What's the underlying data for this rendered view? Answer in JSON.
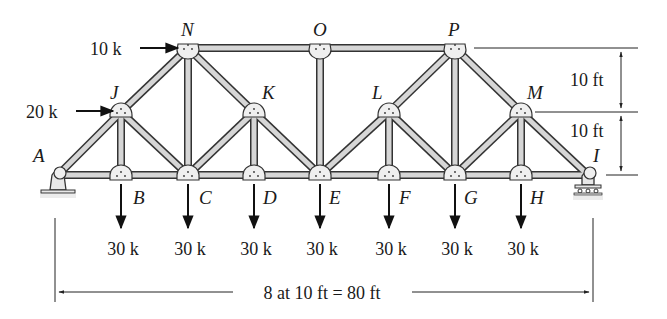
{
  "joints": {
    "A": {
      "label": "A",
      "x": 58,
      "y": 175,
      "label_x": 33,
      "label_y": 162
    },
    "B": {
      "label": "B",
      "x": 121,
      "y": 175,
      "label_x": 133,
      "label_y": 204
    },
    "C": {
      "label": "C",
      "x": 188,
      "y": 175,
      "label_x": 199,
      "label_y": 204
    },
    "D": {
      "label": "D",
      "x": 254,
      "y": 175,
      "label_x": 263,
      "label_y": 204
    },
    "E": {
      "label": "E",
      "x": 320,
      "y": 175,
      "label_x": 329,
      "label_y": 204
    },
    "F": {
      "label": "F",
      "x": 389,
      "y": 175,
      "label_x": 399,
      "label_y": 204
    },
    "G": {
      "label": "G",
      "x": 455,
      "y": 175,
      "label_x": 464,
      "label_y": 204
    },
    "H": {
      "label": "H",
      "x": 521,
      "y": 175,
      "label_x": 530,
      "label_y": 204
    },
    "I": {
      "label": "I",
      "x": 588,
      "y": 175,
      "label_x": 593,
      "label_y": 162
    },
    "J": {
      "label": "J",
      "x": 121,
      "y": 112,
      "label_x": 110,
      "label_y": 99
    },
    "K": {
      "label": "K",
      "x": 254,
      "y": 112,
      "label_x": 262,
      "label_y": 99
    },
    "L": {
      "label": "L",
      "x": 389,
      "y": 112,
      "label_x": 372,
      "label_y": 99
    },
    "M": {
      "label": "M",
      "x": 521,
      "y": 112,
      "label_x": 527,
      "label_y": 99
    },
    "N": {
      "label": "N",
      "x": 188,
      "y": 48,
      "label_x": 181,
      "label_y": 36
    },
    "O": {
      "label": "O",
      "x": 320,
      "y": 48,
      "label_x": 313,
      "label_y": 36
    },
    "P": {
      "label": "P",
      "x": 455,
      "y": 48,
      "label_x": 448,
      "label_y": 36
    }
  },
  "members": [
    [
      "A",
      "B"
    ],
    [
      "B",
      "C"
    ],
    [
      "C",
      "D"
    ],
    [
      "D",
      "E"
    ],
    [
      "E",
      "F"
    ],
    [
      "F",
      "G"
    ],
    [
      "G",
      "H"
    ],
    [
      "H",
      "I"
    ],
    [
      "A",
      "J"
    ],
    [
      "J",
      "N"
    ],
    [
      "N",
      "O"
    ],
    [
      "O",
      "P"
    ],
    [
      "P",
      "M"
    ],
    [
      "M",
      "I"
    ],
    [
      "J",
      "B"
    ],
    [
      "N",
      "C"
    ],
    [
      "K",
      "D"
    ],
    [
      "O",
      "E"
    ],
    [
      "L",
      "F"
    ],
    [
      "P",
      "G"
    ],
    [
      "M",
      "H"
    ],
    [
      "J",
      "C"
    ],
    [
      "N",
      "K"
    ],
    [
      "K",
      "C"
    ],
    [
      "K",
      "E"
    ],
    [
      "L",
      "E"
    ],
    [
      "L",
      "P"
    ],
    [
      "L",
      "G"
    ],
    [
      "M",
      "G"
    ]
  ],
  "horizontal_loads": [
    {
      "label": "10 k",
      "joint": "N",
      "text_x": 90,
      "text_y": 55,
      "x1": 140,
      "x2": 178,
      "y": 48
    },
    {
      "label": "20 k",
      "joint": "J",
      "text_x": 26,
      "text_y": 118,
      "x1": 76,
      "x2": 113,
      "y": 111
    }
  ],
  "vertical_loads": [
    {
      "label": "30 k",
      "joint": "B",
      "x": 121
    },
    {
      "label": "30 k",
      "joint": "C",
      "x": 188
    },
    {
      "label": "30 k",
      "joint": "D",
      "x": 254
    },
    {
      "label": "30 k",
      "joint": "E",
      "x": 320
    },
    {
      "label": "30 k",
      "joint": "F",
      "x": 389
    },
    {
      "label": "30 k",
      "joint": "G",
      "x": 455
    },
    {
      "label": "30 k",
      "joint": "H",
      "x": 521
    }
  ],
  "dimensions": {
    "height_upper": "10 ft",
    "height_lower": "10 ft",
    "span": "8 at 10 ft = 80 ft"
  }
}
